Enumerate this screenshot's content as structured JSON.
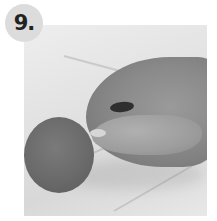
{
  "step_badge": {
    "label": "9.",
    "background": "#dcdcdc",
    "text_color": "#222222"
  },
  "photo": {
    "subject": "hand placing a small dark bean on a marble surface beside a tomato",
    "color_mode": "grayscale",
    "elements": [
      "marble-surface",
      "hand",
      "bean",
      "tomato"
    ]
  }
}
